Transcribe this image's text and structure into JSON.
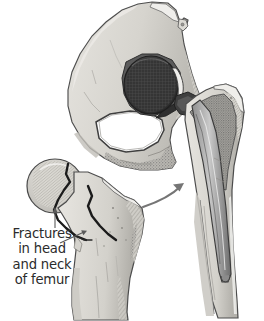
{
  "figure": {
    "kind": "medical-illustration",
    "background_color": "#ffffff",
    "width": 264,
    "height": 321
  },
  "caption": {
    "lines": [
      "Fractures",
      "in head",
      "and neck",
      "of femur"
    ],
    "full_text": "Fractures in head and neck of femur",
    "text_color": "#2b2b2b",
    "align": "center"
  },
  "annotations": {
    "head_pointer_name": "head-fracture-leader-arrow",
    "neck_pointer_name": "neck-fracture-leader-arrow",
    "transition_arrow_name": "replacement-transition-arrow"
  },
  "palette": {
    "background": "#ffffff",
    "bone_light": "#dcdad4",
    "bone_mid": "#c4c2bb",
    "bone_shadow": "#a7a5a0",
    "cortical_outline": "#4a4a4a",
    "cancellous_stipple": "#9a9a9a",
    "prosthesis_dark": "#3a3a3a",
    "prosthesis_mid": "#6e6e6e",
    "prosthesis_head": "#343434",
    "foramen_white": "#ffffff",
    "ink": "#2b2b2b"
  },
  "parts": {
    "pelvis": {
      "label": "Pelvis (innominate bone, cut section)",
      "name": "pelvis-bone"
    },
    "acetabular_cup": {
      "label": "Prosthetic acetabular cup and femoral head",
      "name": "prosthetic-femoral-head"
    },
    "obturator_foramen": {
      "label": "Obturator foramen",
      "name": "obturator-foramen"
    },
    "prosthesis_stem": {
      "label": "Femoral prosthesis stem in medullary canal",
      "name": "prosthesis-stem"
    },
    "prosthesis_collar": {
      "label": "Prosthesis neck and collar with fixation hole",
      "name": "prosthesis-collar"
    },
    "implanted_femur": {
      "label": "Proximal femur with implanted prosthesis",
      "name": "implanted-femur"
    },
    "fractured_femur": {
      "label": "Proximal femur with fractures",
      "name": "fractured-femur"
    },
    "femoral_head_fracture": {
      "label": "Fracture line through femoral head",
      "name": "femoral-head-fracture-line"
    },
    "femoral_neck_fracture": {
      "label": "Fracture line through femoral neck",
      "name": "femoral-neck-fracture-line"
    },
    "greater_trochanter": {
      "label": "Greater trochanter",
      "name": "greater-trochanter"
    },
    "femoral_shaft": {
      "label": "Femoral shaft",
      "name": "femoral-shaft"
    }
  }
}
